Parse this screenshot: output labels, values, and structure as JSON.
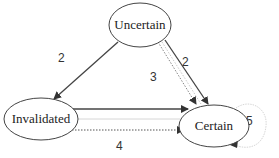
{
  "diagram": {
    "type": "state-transition",
    "nodes": [
      {
        "id": "uncertain",
        "label": "Uncertain"
      },
      {
        "id": "invalidated",
        "label": "Invalidated"
      },
      {
        "id": "certain",
        "label": "Certain"
      }
    ],
    "edges": [
      {
        "from": "uncertain",
        "to": "invalidated",
        "label": "2",
        "style": "solid"
      },
      {
        "from": "uncertain",
        "to": "certain",
        "label": "2",
        "style": "solid"
      },
      {
        "from": "uncertain",
        "to": "certain",
        "label": "3",
        "style": "dotted"
      },
      {
        "from": "invalidated",
        "to": "certain",
        "label": "",
        "style": "solid"
      },
      {
        "from": "invalidated",
        "to": "certain",
        "label": "",
        "style": "faint"
      },
      {
        "from": "invalidated",
        "to": "certain",
        "label": "4",
        "style": "dotted"
      },
      {
        "from": "certain",
        "to": "certain",
        "label": "5",
        "style": "faint-loop"
      }
    ],
    "colors": {
      "stroke": "#333333",
      "faint": "#bbbbbb",
      "background": "#ffffff"
    }
  }
}
